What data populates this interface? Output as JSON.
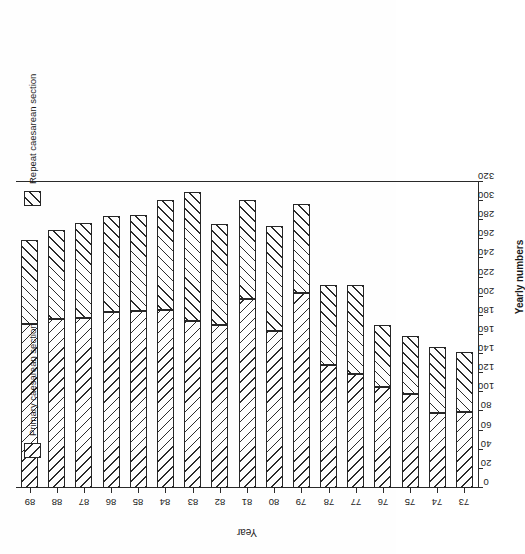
{
  "figure": {
    "orientation_note": "printed-sideways",
    "axis_titles": {
      "value_axis": "Yearly numbers",
      "category_axis": "Year"
    }
  },
  "legend": {
    "entries": [
      {
        "key": "primary",
        "label": "Primary caesarean section",
        "swatch": "diagonal-hatch-forward"
      },
      {
        "key": "repeat",
        "label": "Repeat caesarean section",
        "swatch": "diagonal-hatch-backward"
      }
    ]
  },
  "chart_data": {
    "type": "bar",
    "orientation": "horizontal-stacked",
    "title": "",
    "subtitle": "",
    "xlabel": "Yearly numbers",
    "ylabel": "Year",
    "xlim": [
      0,
      320
    ],
    "ylim": null,
    "grid": false,
    "legend_position": "bottom-outside",
    "tick_step": 20,
    "x_ticks": [
      0,
      20,
      40,
      60,
      80,
      100,
      120,
      140,
      160,
      180,
      200,
      220,
      240,
      260,
      280,
      300,
      320
    ],
    "x_tick_labels": [
      "0",
      "20",
      "40",
      "60",
      "80",
      "100",
      "120",
      "140",
      "160",
      "180",
      "200",
      "220",
      "240",
      "260",
      "280",
      "300",
      "320"
    ],
    "categories": [
      "73",
      "74",
      "75",
      "76",
      "77",
      "78",
      "79",
      "80",
      "81",
      "82",
      "83",
      "84",
      "85",
      "86",
      "87",
      "88",
      "89"
    ],
    "series": [
      {
        "name": "Primary caesarean section",
        "values": [
          79,
          78,
          98,
          106,
          119,
          129,
          204,
          164,
          198,
          170,
          175,
          186,
          185,
          184,
          178,
          177,
          172
        ]
      },
      {
        "name": "Repeat caesarean section",
        "values": [
          63,
          69,
          61,
          64,
          93,
          83,
          93,
          110,
          103,
          106,
          135,
          115,
          101,
          100,
          99,
          93,
          87
        ]
      }
    ],
    "totals": [
      142,
      147,
      159,
      170,
      212,
      212,
      297,
      274,
      301,
      276,
      310,
      301,
      286,
      284,
      277,
      270,
      259
    ]
  }
}
